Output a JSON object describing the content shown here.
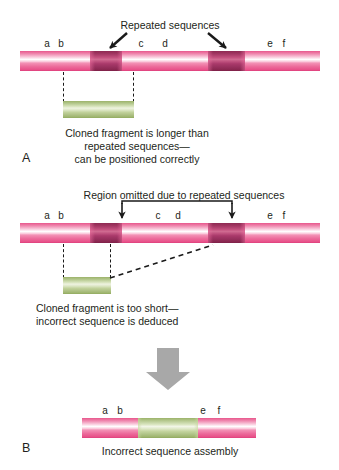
{
  "figure": {
    "background_color": "#ffffff",
    "colors": {
      "chromosome_pink": "#ec6b9b",
      "repeat_dark": "#8e2a52",
      "fragment_green": "#b3c78c",
      "gray_arrow": "#a8a8a8",
      "text": "#231f20"
    }
  },
  "panel_a": {
    "letter": "A",
    "title": "Repeated sequences",
    "sequence_labels": [
      "a",
      "b",
      "c",
      "d",
      "e",
      "f"
    ],
    "caption_lines": [
      "Cloned fragment is longer than",
      "repeated sequences—",
      "can be positioned correctly"
    ]
  },
  "panel_b": {
    "letter": "B",
    "title": "Region omitted due to repeated sequences",
    "sequence_labels": [
      "a",
      "b",
      "c",
      "d",
      "e",
      "f"
    ],
    "caption_lines": [
      "Cloned fragment is too short—",
      "incorrect sequence is deduced"
    ],
    "result_sequence_labels": [
      "a",
      "b",
      "e",
      "f"
    ],
    "result_caption": "Incorrect sequence assembly"
  }
}
